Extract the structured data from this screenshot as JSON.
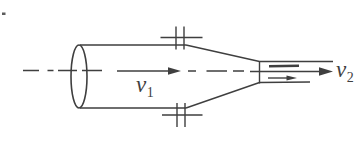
{
  "diagram": {
    "labels": {
      "v1": {
        "base": "v",
        "sub": "1"
      },
      "v2": {
        "base": "v",
        "sub": "2"
      }
    },
    "colors": {
      "line": "#3f3f3f",
      "background": "#ffffff"
    }
  }
}
